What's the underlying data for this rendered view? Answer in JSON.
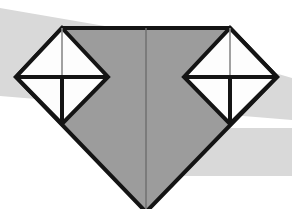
{
  "figure": {
    "width": 292,
    "height": 209,
    "background_color": "#ffffff"
  },
  "colors": {
    "page_background": "#ffffff",
    "band_gray": "#d9d9d9",
    "gem_fill_gray": "#9c9c9c",
    "outline_black": "#141414",
    "facet_line_gray": "#8a8a8a",
    "inner_white": "#fdfdfd"
  },
  "background_bands": [
    {
      "name": "upper-left-sweep-band",
      "fill": "#d9d9d9",
      "points": "0,8 128,30 292,78 292,120 0,96"
    },
    {
      "name": "right-lower-band",
      "fill": "#d9d9d9",
      "points": "196,128 292,128 292,176 178,176"
    }
  ],
  "gem": {
    "name": "main-gem-body",
    "fill": "#9c9c9c",
    "stroke": "#141414",
    "stroke_width": 4,
    "outline_points": "62,28 230,28 277,77 146,212 16,77",
    "vertices": [
      {
        "label": "top-left-shoulder",
        "x": 62,
        "y": 28
      },
      {
        "label": "top-right-shoulder",
        "x": 230,
        "y": 28
      },
      {
        "label": "right-girdle-point",
        "x": 277,
        "y": 77
      },
      {
        "label": "bottom-culet",
        "x": 146,
        "y": 212
      },
      {
        "label": "left-girdle-point",
        "x": 16,
        "y": 77
      }
    ],
    "center_facet_line": {
      "x1": 146,
      "y1": 28,
      "x2": 146,
      "y2": 209,
      "stroke": "#6e6e6e",
      "stroke_width": 1.4
    }
  },
  "left_diamond": {
    "name": "left-inset-diamond",
    "fill": "#fdfdfd",
    "stroke": "#141414",
    "stroke_width": 4,
    "outline_points": "62,28 108,77 62,124 16,77",
    "vertices": [
      {
        "label": "apex",
        "x": 62,
        "y": 28
      },
      {
        "label": "right",
        "x": 108,
        "y": 77
      },
      {
        "label": "bottom",
        "x": 62,
        "y": 124
      },
      {
        "label": "left",
        "x": 16,
        "y": 77
      }
    ],
    "horizontal_divider": {
      "x1": 16,
      "y1": 77,
      "x2": 108,
      "y2": 77,
      "stroke": "#141414",
      "stroke_width": 4
    },
    "upper_stem": {
      "x1": 62,
      "y1": 28,
      "x2": 62,
      "y2": 77,
      "stroke": "#8a8a8a",
      "stroke_width": 1.6
    },
    "lower_stem": {
      "x1": 62,
      "y1": 77,
      "x2": 62,
      "y2": 124,
      "stroke": "#141414",
      "stroke_width": 4
    }
  },
  "right_diamond": {
    "name": "right-inset-diamond",
    "fill": "#fdfdfd",
    "stroke": "#141414",
    "stroke_width": 4,
    "outline_points": "230,28 277,77 230,124 184,77",
    "vertices": [
      {
        "label": "apex",
        "x": 230,
        "y": 28
      },
      {
        "label": "right",
        "x": 277,
        "y": 77
      },
      {
        "label": "bottom",
        "x": 230,
        "y": 124
      },
      {
        "label": "left",
        "x": 184,
        "y": 77
      }
    ],
    "horizontal_divider": {
      "x1": 184,
      "y1": 77,
      "x2": 277,
      "y2": 77,
      "stroke": "#141414",
      "stroke_width": 4
    },
    "upper_stem": {
      "x1": 230,
      "y1": 28,
      "x2": 230,
      "y2": 77,
      "stroke": "#8a8a8a",
      "stroke_width": 1.6
    },
    "lower_stem": {
      "x1": 230,
      "y1": 77,
      "x2": 230,
      "y2": 124,
      "stroke": "#141414",
      "stroke_width": 4
    }
  }
}
